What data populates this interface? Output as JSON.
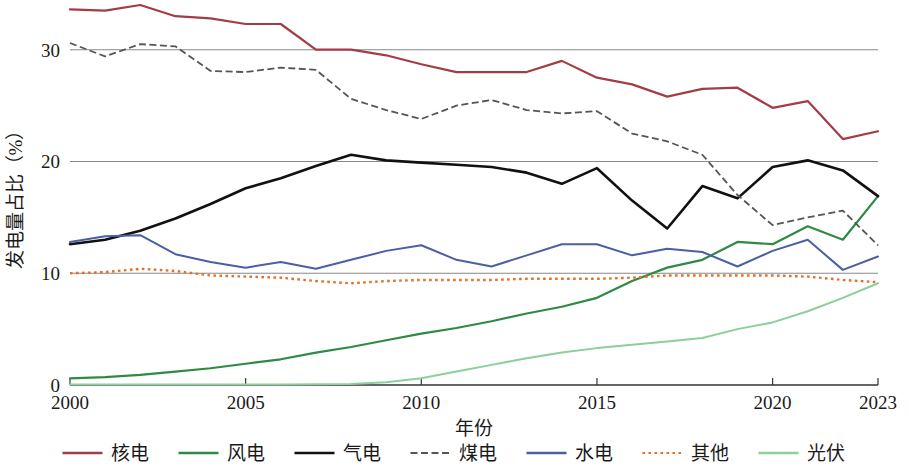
{
  "chart_data": {
    "type": "line",
    "title": "",
    "xlabel": "年份",
    "ylabel": "发电量占比（%）",
    "xlim": [
      2000,
      2023
    ],
    "ylim": [
      0,
      34
    ],
    "grid": true,
    "legend_position": "bottom",
    "x": [
      2000,
      2001,
      2002,
      2003,
      2004,
      2005,
      2006,
      2007,
      2008,
      2009,
      2010,
      2011,
      2012,
      2013,
      2014,
      2015,
      2016,
      2017,
      2018,
      2019,
      2020,
      2021,
      2022,
      2023
    ],
    "xticks": [
      2000,
      2005,
      2010,
      2015,
      2020,
      2023
    ],
    "xtick_labels": [
      "2000",
      "2005",
      "2010",
      "2015",
      "2020",
      "2023"
    ],
    "yticks": [
      0,
      10,
      20,
      30
    ],
    "ytick_labels": [
      "0",
      "10",
      "20",
      "30"
    ],
    "series": [
      {
        "name": "核电",
        "key": "nuclear",
        "color": "#a43c46",
        "style": "solid",
        "width": 2.2,
        "values": [
          33.6,
          33.5,
          34.0,
          33.0,
          32.8,
          32.3,
          32.3,
          30.0,
          30.0,
          29.5,
          28.7,
          28.0,
          28.0,
          28.0,
          29.0,
          27.5,
          26.9,
          25.8,
          26.5,
          26.6,
          24.8,
          25.4,
          22.0,
          22.7
        ]
      },
      {
        "name": "风电",
        "key": "wind",
        "color": "#2f8a43",
        "style": "solid",
        "width": 2.2,
        "values": [
          0.6,
          0.7,
          0.9,
          1.2,
          1.5,
          1.9,
          2.3,
          2.9,
          3.4,
          4.0,
          4.6,
          5.1,
          5.7,
          6.4,
          7.0,
          7.8,
          9.3,
          10.5,
          11.2,
          12.8,
          12.6,
          14.2,
          13.0,
          16.9
        ]
      },
      {
        "name": "气电",
        "key": "gas",
        "color": "#111111",
        "style": "solid",
        "width": 2.6,
        "values": [
          12.6,
          13.0,
          13.8,
          14.9,
          16.2,
          17.6,
          18.5,
          19.6,
          20.6,
          20.1,
          19.9,
          19.7,
          19.5,
          19.0,
          18.0,
          19.4,
          16.5,
          14.0,
          17.8,
          16.7,
          19.5,
          20.1,
          19.2,
          16.9
        ]
      },
      {
        "name": "煤电",
        "key": "coal",
        "color": "#555555",
        "style": "dashed",
        "width": 1.8,
        "values": [
          30.6,
          29.4,
          30.5,
          30.3,
          28.1,
          28.0,
          28.4,
          28.2,
          25.6,
          24.6,
          23.8,
          25.0,
          25.5,
          24.6,
          24.3,
          24.5,
          22.5,
          21.8,
          20.6,
          17.0,
          14.3,
          15.0,
          15.6,
          12.5
        ]
      },
      {
        "name": "水电",
        "key": "hydro",
        "color": "#4a5fa5",
        "style": "solid",
        "width": 2.0,
        "values": [
          12.8,
          13.3,
          13.4,
          11.7,
          11.0,
          10.5,
          11.0,
          10.4,
          11.2,
          12.0,
          12.5,
          11.2,
          10.6,
          11.6,
          12.6,
          12.6,
          11.6,
          12.2,
          11.9,
          10.6,
          12.0,
          13.0,
          10.3,
          11.5
        ]
      },
      {
        "name": "其他",
        "key": "other",
        "color": "#e3702a",
        "style": "dotted",
        "width": 2.4,
        "values": [
          10.0,
          10.1,
          10.4,
          10.2,
          9.8,
          9.7,
          9.6,
          9.3,
          9.1,
          9.3,
          9.4,
          9.4,
          9.4,
          9.5,
          9.5,
          9.5,
          9.6,
          9.8,
          9.8,
          9.8,
          9.8,
          9.7,
          9.4,
          9.2
        ]
      },
      {
        "name": "光伏",
        "key": "solar",
        "color": "#8bcf9a",
        "style": "solid",
        "width": 2.0,
        "values": [
          0.05,
          0.05,
          0.05,
          0.05,
          0.05,
          0.05,
          0.05,
          0.06,
          0.1,
          0.25,
          0.6,
          1.2,
          1.8,
          2.4,
          2.9,
          3.3,
          3.6,
          3.9,
          4.2,
          5.0,
          5.6,
          6.6,
          7.8,
          9.1
        ]
      }
    ]
  },
  "legend": {
    "items": [
      {
        "label": "核电",
        "color": "#a43c46",
        "style": "solid"
      },
      {
        "label": "风电",
        "color": "#2f8a43",
        "style": "solid"
      },
      {
        "label": "气电",
        "color": "#111111",
        "style": "solid"
      },
      {
        "label": "煤电",
        "color": "#555555",
        "style": "dashed"
      },
      {
        "label": "水电",
        "color": "#4a5fa5",
        "style": "solid"
      },
      {
        "label": "其他",
        "color": "#e3702a",
        "style": "dotted"
      },
      {
        "label": "光伏",
        "color": "#8bcf9a",
        "style": "solid"
      }
    ]
  }
}
